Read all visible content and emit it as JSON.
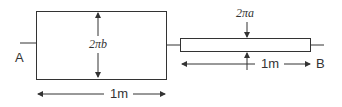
{
  "diagram": {
    "terminal_a": "A",
    "terminal_b": "B",
    "wide_conductor": {
      "height_label": "2πb",
      "length_label": "1m"
    },
    "narrow_conductor": {
      "height_label": "2πa",
      "length_label": "1m"
    },
    "colors": {
      "stroke": "#333333",
      "background": "#ffffff"
    }
  }
}
